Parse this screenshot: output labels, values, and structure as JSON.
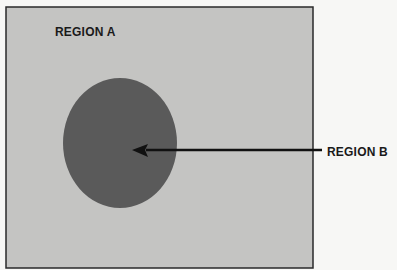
{
  "diagram": {
    "region_a": {
      "label": "REGION A",
      "fill": "#c4c4c2",
      "border": "#2a2a2a"
    },
    "region_b": {
      "label": "REGION B",
      "fill": "#5a5a5a"
    },
    "arrow": {
      "color": "#111111",
      "from_label": "REGION B",
      "points_to": "region_b"
    }
  }
}
